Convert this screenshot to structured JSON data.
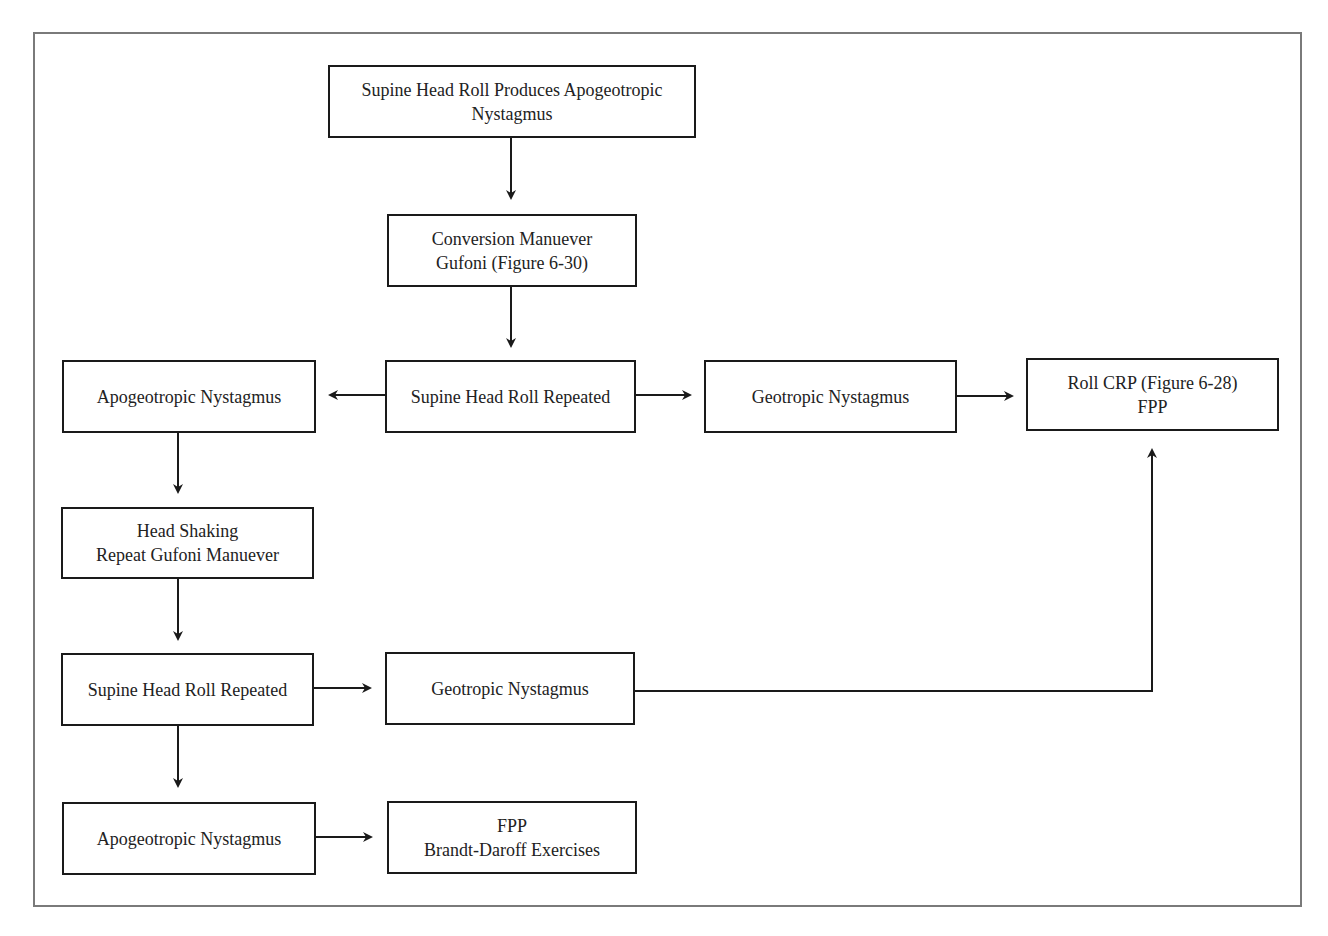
{
  "diagram": {
    "type": "flowchart",
    "colors": {
      "box_border": "#1a1a1a",
      "arrow": "#1a1a1a",
      "frame": "#7a7a7a",
      "text": "#222222",
      "background": "#ffffff"
    },
    "nodes": {
      "start": {
        "line1": "Supine Head Roll Produces Apogeotropic",
        "line2": "Nystagmus"
      },
      "gufoni": {
        "line1": "Conversion Manuever",
        "line2": "Gufoni (Figure 6-30)"
      },
      "roll_repeated_1": {
        "line1": "Supine Head Roll Repeated"
      },
      "apogeo_1": {
        "line1": "Apogeotropic Nystagmus"
      },
      "geo_1": {
        "line1": "Geotropic Nystagmus"
      },
      "roll_crp": {
        "line1": "Roll CRP (Figure 6-28)",
        "line2": "FPP"
      },
      "head_shaking": {
        "line1": "Head Shaking",
        "line2": "Repeat Gufoni Manuever"
      },
      "roll_repeated_2": {
        "line1": "Supine Head Roll Repeated"
      },
      "geo_2": {
        "line1": "Geotropic Nystagmus"
      },
      "apogeo_2": {
        "line1": "Apogeotropic Nystagmus"
      },
      "fpp_bd": {
        "line1": "FPP",
        "line2": "Brandt-Daroff Exercises"
      }
    },
    "edges": [
      {
        "from": "start",
        "to": "gufoni"
      },
      {
        "from": "gufoni",
        "to": "roll_repeated_1"
      },
      {
        "from": "roll_repeated_1",
        "to": "apogeo_1"
      },
      {
        "from": "roll_repeated_1",
        "to": "geo_1"
      },
      {
        "from": "geo_1",
        "to": "roll_crp"
      },
      {
        "from": "apogeo_1",
        "to": "head_shaking"
      },
      {
        "from": "head_shaking",
        "to": "roll_repeated_2"
      },
      {
        "from": "roll_repeated_2",
        "to": "geo_2"
      },
      {
        "from": "geo_2",
        "to": "roll_crp"
      },
      {
        "from": "roll_repeated_2",
        "to": "apogeo_2"
      },
      {
        "from": "apogeo_2",
        "to": "fpp_bd"
      }
    ]
  }
}
